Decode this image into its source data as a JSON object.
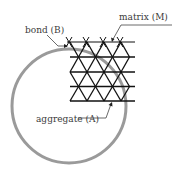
{
  "labels": {
    "matrix": "matrix (M)",
    "bond": "bond (B)",
    "aggregate": "aggregate (A)"
  },
  "colors": {
    "ink": "#111111",
    "circle": "#9a9a9a",
    "leader": "#444444",
    "text": "#3a3a3a"
  },
  "diagram": {
    "circle": {
      "cx": 69,
      "cy": 106,
      "r": 57
    },
    "grid": {
      "x_start": 70,
      "x_end": 135,
      "rows_y": [
        42,
        57,
        72,
        86.5,
        101
      ],
      "cell_width": 17
    }
  }
}
